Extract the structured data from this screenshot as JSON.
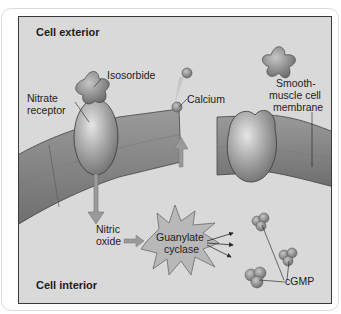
{
  "diagram": {
    "regions": {
      "exterior": "Cell exterior",
      "interior": "Cell interior"
    },
    "labels": {
      "isosorbide": "Isosorbide",
      "nitrate_receptor_line1": "Nitrate",
      "nitrate_receptor_line2": "receptor",
      "calcium": "Calcium",
      "membrane_line1": "Smooth-",
      "membrane_line2": "muscle cell",
      "membrane_line3": "membrane",
      "nitric_oxide_line1": "Nitric",
      "nitric_oxide_line2": "oxide",
      "guanylate_line1": "Guanylate",
      "guanylate_line2": "cyclase",
      "cgmp": "cGMP"
    },
    "colors": {
      "background": "#d9d9d9",
      "membrane": "#8c8c8c",
      "receptor": "#a8a8a8",
      "frame": "#3a3a3a",
      "text": "#1c1c1c"
    }
  }
}
